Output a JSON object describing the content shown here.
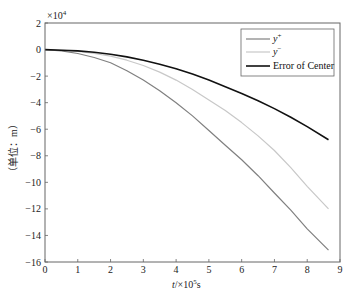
{
  "chart_data": {
    "type": "line",
    "title": "",
    "xlabel": "t/×10^5s",
    "ylabel": "（单位：m）",
    "y_multiplier": "×10^4",
    "xlim": [
      0,
      9
    ],
    "ylim": [
      -16,
      2
    ],
    "xticks": [
      0,
      1,
      2,
      3,
      4,
      5,
      6,
      7,
      8,
      9
    ],
    "yticks": [
      2,
      0,
      -2,
      -4,
      -6,
      -8,
      -10,
      -12,
      -14,
      -16
    ],
    "grid": false,
    "legend_position": "upper right",
    "x": [
      0,
      0.5,
      1,
      1.5,
      2,
      2.5,
      3,
      3.5,
      4,
      4.5,
      5,
      5.5,
      6,
      6.5,
      7,
      7.5,
      8,
      8.65
    ],
    "series": [
      {
        "name": "y+",
        "color": "#808080",
        "width": 1.2,
        "values": [
          0,
          -0.1,
          -0.3,
          -0.6,
          -1.0,
          -1.6,
          -2.3,
          -3.1,
          -4.0,
          -5.0,
          -6.1,
          -7.2,
          -8.3,
          -9.5,
          -10.8,
          -12.1,
          -13.5,
          -15.1
        ]
      },
      {
        "name": "y-",
        "color": "#c8c8c8",
        "width": 1.2,
        "values": [
          0,
          -0.05,
          -0.15,
          -0.3,
          -0.5,
          -0.8,
          -1.2,
          -1.7,
          -2.3,
          -3.0,
          -3.8,
          -4.6,
          -5.5,
          -6.5,
          -7.6,
          -8.9,
          -10.3,
          -12.0
        ]
      },
      {
        "name": "Error of Center",
        "color": "#111111",
        "width": 1.6,
        "values": [
          0,
          -0.05,
          -0.1,
          -0.2,
          -0.35,
          -0.55,
          -0.8,
          -1.1,
          -1.45,
          -1.85,
          -2.3,
          -2.8,
          -3.3,
          -3.85,
          -4.45,
          -5.1,
          -5.8,
          -6.8
        ]
      }
    ]
  },
  "labels": {
    "multiplier_base": "×10",
    "multiplier_exp": "4",
    "x_axis_t": "t",
    "x_axis_rest": "/×10",
    "x_axis_exp": "5",
    "x_axis_unit": "s",
    "y_axis": "（单位：m）"
  },
  "legend": [
    {
      "label_main": "y",
      "label_sup": "+"
    },
    {
      "label_main": "y",
      "label_sup": "−"
    },
    {
      "label_main": "Error of Center",
      "label_sup": ""
    }
  ]
}
